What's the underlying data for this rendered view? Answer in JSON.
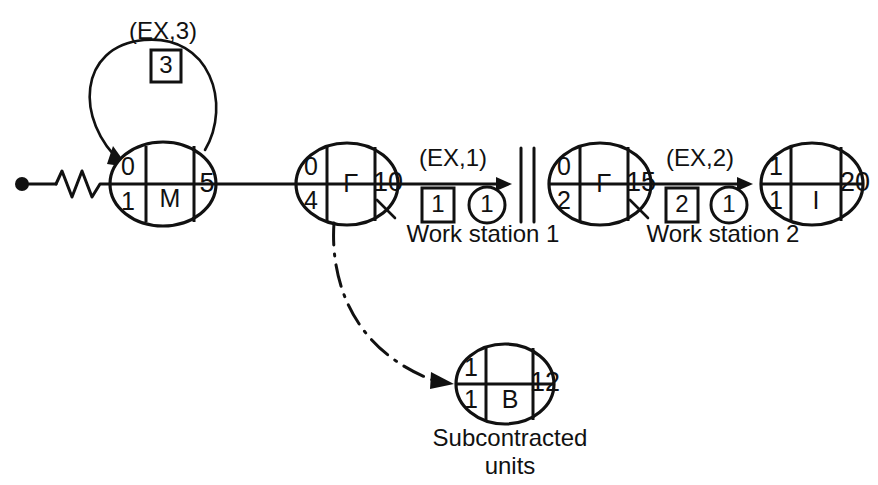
{
  "diagram": {
    "background": "#ffffff",
    "ink": "#111111",
    "start": {
      "name": "start-terminal"
    },
    "nodes": [
      {
        "id": "node-m",
        "top_left": "0",
        "bottom_left": "1",
        "letter": "M",
        "duration": "5",
        "has_tick": false,
        "middle_split": false
      },
      {
        "id": "node-f1",
        "top_left": "0",
        "bottom_left": "4",
        "letter": "F",
        "duration": "10",
        "has_tick": true,
        "middle_split": false
      },
      {
        "id": "node-f2",
        "top_left": "0",
        "bottom_left": "2",
        "letter": "F",
        "duration": "15",
        "has_tick": true,
        "middle_split": false
      },
      {
        "id": "node-i",
        "top_left": "1",
        "bottom_left": "1",
        "letter": "I",
        "duration": "20",
        "has_tick": false,
        "middle_split": true
      },
      {
        "id": "node-b",
        "top_left": "1",
        "bottom_left": "1",
        "letter": "B",
        "duration": "12",
        "has_tick": false,
        "middle_split": true
      }
    ],
    "self_loop": {
      "name": "self-loop-ex3",
      "label": "(EX,3)",
      "box_value": "3"
    },
    "edges": [
      {
        "id": "edge-ws1",
        "label": "(EX,1)",
        "box_value": "1",
        "circle_value": "1",
        "caption": "Work station 1"
      },
      {
        "id": "edge-ws2",
        "label": "(EX,2)",
        "box_value": "2",
        "circle_value": "1",
        "caption": "Work station 2"
      }
    ],
    "subcontract": {
      "caption_line1": "Subcontracted",
      "caption_line2": "units"
    }
  }
}
